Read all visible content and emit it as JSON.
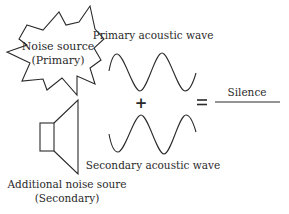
{
  "diagram": {
    "primary_source": {
      "shape": "starburst",
      "label_line1": "Noise source",
      "label_line2": "(Primary)"
    },
    "secondary_source": {
      "shape": "speaker-icon",
      "label_line1": "Additional noise soure",
      "label_line2": "(Secondary)"
    },
    "primary_wave": {
      "label": "Primary acoustic wave",
      "shape": "sine-wave"
    },
    "secondary_wave": {
      "label": "Secondary acoustic wave",
      "shape": "inverted-sine-wave"
    },
    "operator_plus": "+",
    "operator_equals": "=",
    "result": {
      "label": "Silence",
      "shape": "flat-line"
    },
    "colors": {
      "stroke": "#2a2a2a",
      "background": "#ffffff"
    }
  }
}
